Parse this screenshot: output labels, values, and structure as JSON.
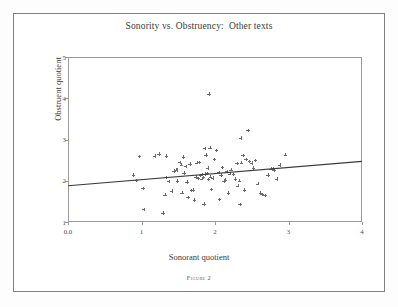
{
  "figure": {
    "title": "Sonority vs. Obstruency:  Other texts",
    "caption": "Figure 2"
  },
  "chart_data": {
    "type": "scatter",
    "title": "Sonority vs. Obstruency:  Other texts",
    "xlabel": "Sonorant quotient",
    "ylabel": "Obstruent quotient",
    "xlim": [
      0,
      4
    ],
    "ylim": [
      1,
      5
    ],
    "xticks": [
      0,
      1,
      2,
      3,
      4
    ],
    "xtick_labels": [
      "0.0",
      "1",
      "2",
      "3",
      "4"
    ],
    "yticks": [
      1,
      2,
      3,
      4,
      5
    ],
    "ytick_labels": [
      "1",
      "2",
      "3",
      "4",
      "5"
    ],
    "grid": false,
    "legend": null,
    "marker": "plus",
    "marker_color": "#6c6c6c",
    "trendline": {
      "label": "linear fit",
      "color": "#3a3a3a",
      "x": [
        0,
        4
      ],
      "y": [
        1.88,
        2.47
      ]
    },
    "points": [
      [
        0.89,
        2.14
      ],
      [
        0.93,
        2.01
      ],
      [
        0.97,
        2.59
      ],
      [
        1.02,
        1.81
      ],
      [
        1.03,
        1.31
      ],
      [
        1.18,
        2.6
      ],
      [
        1.24,
        2.65
      ],
      [
        1.29,
        1.22
      ],
      [
        1.32,
        1.66
      ],
      [
        1.34,
        2.08
      ],
      [
        1.34,
        2.6
      ],
      [
        1.37,
        1.98
      ],
      [
        1.41,
        1.75
      ],
      [
        1.44,
        2.24
      ],
      [
        1.47,
        2.27
      ],
      [
        1.48,
        2.26
      ],
      [
        1.49,
        1.99
      ],
      [
        1.52,
        2.45
      ],
      [
        1.54,
        2.39
      ],
      [
        1.55,
        1.71
      ],
      [
        1.57,
        2.58
      ],
      [
        1.58,
        2.19
      ],
      [
        1.6,
        2.35
      ],
      [
        1.62,
        1.97
      ],
      [
        1.63,
        1.6
      ],
      [
        1.66,
        2.41
      ],
      [
        1.68,
        1.77
      ],
      [
        1.7,
        1.78
      ],
      [
        1.72,
        1.53
      ],
      [
        1.74,
        2.1
      ],
      [
        1.75,
        2.44
      ],
      [
        1.77,
        2.06
      ],
      [
        1.79,
        2.45
      ],
      [
        1.8,
        2.13
      ],
      [
        1.82,
        2.05
      ],
      [
        1.83,
        2.15
      ],
      [
        1.84,
        2.08
      ],
      [
        1.85,
        1.44
      ],
      [
        1.86,
        2.78
      ],
      [
        1.87,
        2.16
      ],
      [
        1.88,
        2.62
      ],
      [
        1.89,
        2.18
      ],
      [
        1.9,
        2.31
      ],
      [
        1.91,
        2.03
      ],
      [
        1.92,
        4.1
      ],
      [
        1.93,
        2.8
      ],
      [
        1.94,
        2.1
      ],
      [
        1.95,
        1.79
      ],
      [
        1.97,
        2.07
      ],
      [
        1.99,
        2.52
      ],
      [
        2.02,
        2.74
      ],
      [
        2.05,
        2.2
      ],
      [
        2.06,
        1.55
      ],
      [
        2.08,
        2.14
      ],
      [
        2.1,
        2.32
      ],
      [
        2.12,
        1.99
      ],
      [
        2.14,
        2.02
      ],
      [
        2.16,
        2.23
      ],
      [
        2.18,
        1.7
      ],
      [
        2.2,
        2.17
      ],
      [
        2.22,
        2.27
      ],
      [
        2.25,
        2.15
      ],
      [
        2.28,
        2.04
      ],
      [
        2.3,
        2.42
      ],
      [
        2.31,
        1.88
      ],
      [
        2.33,
        2.0
      ],
      [
        2.34,
        1.43
      ],
      [
        2.35,
        3.04
      ],
      [
        2.36,
        2.44
      ],
      [
        2.38,
        2.61
      ],
      [
        2.4,
        1.78
      ],
      [
        2.42,
        2.52
      ],
      [
        2.45,
        3.22
      ],
      [
        2.47,
        2.47
      ],
      [
        2.5,
        2.43
      ],
      [
        2.52,
        2.31
      ],
      [
        2.55,
        2.49
      ],
      [
        2.58,
        1.93
      ],
      [
        2.62,
        1.7
      ],
      [
        2.64,
        1.67
      ],
      [
        2.68,
        1.65
      ],
      [
        2.72,
        2.14
      ],
      [
        2.76,
        2.29
      ],
      [
        2.79,
        2.3
      ],
      [
        2.8,
        2.26
      ],
      [
        2.84,
        2.04
      ],
      [
        2.88,
        2.38
      ],
      [
        2.96,
        2.63
      ]
    ]
  }
}
